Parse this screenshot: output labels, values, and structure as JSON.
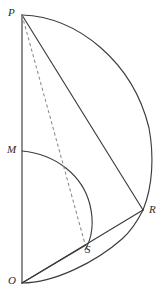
{
  "figure": {
    "kind": "geometry-diagram",
    "canvas": {
      "width": 166,
      "height": 298
    },
    "colors": {
      "background": "#ffffff",
      "solid_stroke": "#3c3c3c",
      "dashed_stroke": "#8a8a8a",
      "label_text": "#2b2b2b"
    },
    "points": [
      {
        "id": "P",
        "label": "P",
        "x": 22,
        "y": 15,
        "label_x": 8,
        "label_y": 7
      },
      {
        "id": "M",
        "label": "M",
        "x": 22,
        "y": 151,
        "label_x": 7,
        "label_y": 144
      },
      {
        "id": "O",
        "label": "O",
        "x": 22,
        "y": 283,
        "label_x": 8,
        "label_y": 275
      },
      {
        "id": "R",
        "label": "R",
        "x": 143,
        "y": 210,
        "label_x": 149,
        "label_y": 204
      },
      {
        "id": "S",
        "label": "S",
        "x": 85,
        "y": 244,
        "label_x": 85,
        "label_y": 244
      }
    ],
    "segments": [
      {
        "id": "OP",
        "from": "O",
        "to": "P",
        "style": "solid"
      },
      {
        "id": "PR",
        "from": "P",
        "to": "R",
        "style": "solid"
      },
      {
        "id": "OR",
        "from": "O",
        "to": "R",
        "style": "solid"
      },
      {
        "id": "OS",
        "from": "O",
        "to": "S",
        "style": "solid"
      },
      {
        "id": "PS",
        "from": "P",
        "to": "S",
        "style": "dashed"
      }
    ],
    "arcs": [
      {
        "id": "arc-PR",
        "from": "P",
        "to": "R",
        "bulge": "right",
        "max_x": 152,
        "style": "solid"
      },
      {
        "id": "arc-MS",
        "from": "M",
        "to": "S",
        "bulge": "right",
        "max_x": 91,
        "style": "solid"
      },
      {
        "id": "arc-OR",
        "from": "O",
        "to": "R",
        "bulge": "down",
        "style": "solid"
      }
    ]
  }
}
